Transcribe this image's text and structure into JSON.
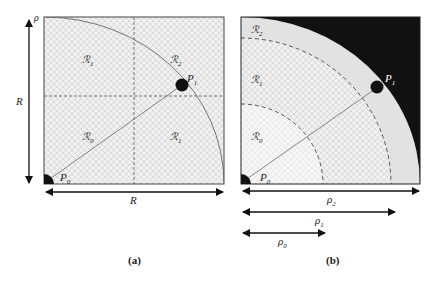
{
  "colors": {
    "background": "#ffffff",
    "hatch_fill": "#efefef",
    "hatch_line": "#cfcfcf",
    "annulus_light": "#e4e4e4",
    "outside": "#111111",
    "stroke": "#333333"
  },
  "panel_a": {
    "caption": "(a)",
    "corner_label": "ρ",
    "side_label": "R",
    "bottom_label": "R",
    "regions": {
      "top_left": "ℛ",
      "top_left_sub": "1",
      "top_right": "ℛ",
      "top_right_sub": "2",
      "bottom_left": "ℛ",
      "bottom_left_sub": "0",
      "bottom_right": "ℛ",
      "bottom_right_sub": "1"
    },
    "points": {
      "p0": "P",
      "p0_sub": "0",
      "p1": "P",
      "p1_sub": "1"
    }
  },
  "panel_b": {
    "caption": "(b)",
    "regions": {
      "r2": "ℛ",
      "r2_sub": "2",
      "r1": "ℛ",
      "r1_sub": "1",
      "r0": "ℛ",
      "r0_sub": "0"
    },
    "points": {
      "p0": "P",
      "p0_sub": "0",
      "p1": "P",
      "p1_sub": "1"
    },
    "radii": [
      {
        "label": "ρ",
        "sub": "2"
      },
      {
        "label": "ρ",
        "sub": "1"
      },
      {
        "label": "ρ",
        "sub": "0"
      }
    ]
  }
}
